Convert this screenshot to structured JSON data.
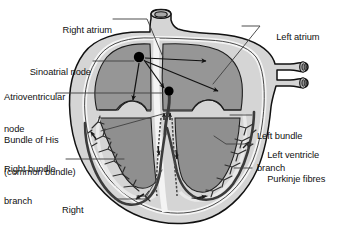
{
  "figure": {
    "type": "anatomical-diagram",
    "background_color": "#ffffff",
    "line_color": "#111111"
  },
  "colors": {
    "outer_myocardium": "#d5d5d5",
    "chamber_fill": "#969696",
    "endocardium": "#f2f2f2",
    "vessel_fill": "#cfcfcf",
    "node_marker": "#000000",
    "conduction_path": "#3b3b3b",
    "outline": "#111111"
  },
  "labels": {
    "left": [
      {
        "id": "right-atrium",
        "text": "Right atrium"
      },
      {
        "id": "sinoatrial-node",
        "text": "Sinoatrial node"
      },
      {
        "id": "atrioventricular-node",
        "line1": "Atrioventricular",
        "line2": "node"
      },
      {
        "id": "bundle-of-his",
        "line1": "Bundle of His",
        "line2": "(common bundle)"
      },
      {
        "id": "right-bundle-branch",
        "line1": "Right bundle",
        "line2": "branch"
      },
      {
        "id": "right-ventricle",
        "line1": "Right",
        "line2": "ventricle"
      }
    ],
    "right": [
      {
        "id": "left-atrium",
        "text": "Left atrium"
      },
      {
        "id": "left-bundle-branch",
        "line1": "Left bundle",
        "line2": "branch"
      },
      {
        "id": "left-ventricle",
        "text": "Left ventricle"
      },
      {
        "id": "purkinje-fibres",
        "text": "Purkinje fibres"
      }
    ]
  },
  "structures": {
    "sinoatrial_node": {
      "x": 139,
      "y": 57,
      "r": 5.2
    },
    "atrioventricular_node": {
      "x": 169,
      "y": 91,
      "r": 4.6
    },
    "vessels": {
      "aorta_stub": "top-centre",
      "pulmonary_veins": 2
    },
    "conduction_arrows": 8
  }
}
